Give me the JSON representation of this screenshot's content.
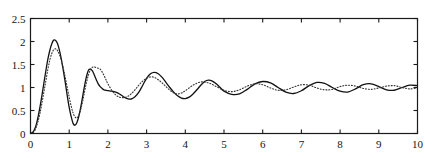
{
  "figure": {
    "background_color": "#ffffff",
    "axes_color": "#1a1a1a",
    "curve_color": "#111111"
  },
  "chart_data": {
    "type": "line",
    "title": "",
    "subtitle": "",
    "xlabel": "",
    "ylabel": "",
    "xlim": [
      0,
      10
    ],
    "ylim": [
      0,
      2.5
    ],
    "xticks": [
      0,
      1,
      2,
      3,
      4,
      5,
      6,
      7,
      8,
      9,
      10
    ],
    "xtick_labels": [
      "0",
      "1",
      "2",
      "3",
      "4",
      "5",
      "6",
      "7",
      "8",
      "9",
      "10"
    ],
    "yticks": [
      0,
      0.5,
      1,
      1.5,
      2,
      2.5
    ],
    "ytick_labels": [
      "0",
      "0.5",
      "1",
      "1.5",
      "2",
      "2.5"
    ],
    "grid": false,
    "legend": false,
    "legend_position": "none",
    "box": true,
    "tick_direction": "in",
    "steady_state_value": 1,
    "annotations": [],
    "series": [
      {
        "name": "solid-response",
        "linestyle": "solid",
        "color": "#111111",
        "linewidth": 1.3,
        "x": [
          0,
          0.05,
          0.1,
          0.15,
          0.2,
          0.25,
          0.3,
          0.35,
          0.4,
          0.45,
          0.5,
          0.55,
          0.6,
          0.65,
          0.7,
          0.75,
          0.8,
          0.85,
          0.9,
          0.95,
          1.0,
          1.05,
          1.1,
          1.15,
          1.2,
          1.25,
          1.3,
          1.35,
          1.4,
          1.45,
          1.5,
          1.55,
          1.6,
          1.65,
          1.7,
          1.75,
          1.8,
          1.85,
          1.9,
          1.95,
          2.0,
          2.1,
          2.2,
          2.3,
          2.4,
          2.5,
          2.6,
          2.7,
          2.8,
          2.9,
          3.0,
          3.1,
          3.2,
          3.3,
          3.4,
          3.5,
          3.6,
          3.7,
          3.8,
          3.9,
          4.0,
          4.1,
          4.2,
          4.3,
          4.4,
          4.5,
          4.6,
          4.7,
          4.8,
          4.9,
          5.0,
          5.2,
          5.4,
          5.6,
          5.8,
          6.0,
          6.2,
          6.4,
          6.6,
          6.8,
          7.0,
          7.2,
          7.4,
          7.6,
          7.8,
          8.0,
          8.2,
          8.4,
          8.6,
          8.8,
          9.0,
          9.2,
          9.4,
          9.6,
          9.8,
          10.0
        ],
        "y": [
          0.0,
          0.02,
          0.08,
          0.2,
          0.38,
          0.6,
          0.85,
          1.12,
          1.38,
          1.62,
          1.81,
          1.95,
          2.03,
          2.02,
          1.95,
          1.8,
          1.6,
          1.36,
          1.1,
          0.82,
          0.57,
          0.37,
          0.22,
          0.18,
          0.24,
          0.38,
          0.58,
          0.82,
          1.05,
          1.25,
          1.38,
          1.4,
          1.36,
          1.27,
          1.17,
          1.08,
          1.02,
          0.98,
          0.95,
          0.94,
          0.93,
          0.92,
          0.9,
          0.86,
          0.8,
          0.76,
          0.75,
          0.8,
          0.9,
          1.05,
          1.2,
          1.3,
          1.33,
          1.3,
          1.22,
          1.11,
          1.0,
          0.9,
          0.82,
          0.77,
          0.76,
          0.79,
          0.86,
          0.95,
          1.05,
          1.13,
          1.16,
          1.14,
          1.08,
          1.0,
          0.92,
          0.85,
          0.86,
          0.96,
          1.08,
          1.13,
          1.1,
          1.0,
          0.9,
          0.87,
          0.93,
          1.04,
          1.11,
          1.09,
          1.0,
          0.92,
          0.9,
          0.97,
          1.06,
          1.08,
          1.02,
          0.95,
          0.94,
          1.0,
          1.05,
          1.04
        ]
      },
      {
        "name": "dotted-response",
        "linestyle": "dotted",
        "color": "#333333",
        "linewidth": 1.1,
        "x": [
          0,
          0.05,
          0.1,
          0.15,
          0.2,
          0.25,
          0.3,
          0.35,
          0.4,
          0.45,
          0.5,
          0.55,
          0.6,
          0.65,
          0.7,
          0.75,
          0.8,
          0.85,
          0.9,
          0.95,
          1.0,
          1.05,
          1.1,
          1.15,
          1.2,
          1.25,
          1.3,
          1.35,
          1.4,
          1.45,
          1.5,
          1.55,
          1.6,
          1.65,
          1.7,
          1.75,
          1.8,
          1.85,
          1.9,
          1.95,
          2.0,
          2.1,
          2.2,
          2.3,
          2.4,
          2.5,
          2.6,
          2.7,
          2.8,
          2.9,
          3.0,
          3.1,
          3.2,
          3.3,
          3.4,
          3.5,
          3.6,
          3.7,
          3.8,
          3.9,
          4.0,
          4.2,
          4.4,
          4.6,
          4.8,
          5.0,
          5.2,
          5.4,
          5.6,
          5.8,
          6.0,
          6.2,
          6.4,
          6.6,
          6.8,
          7.0,
          7.2,
          7.4,
          7.6,
          7.8,
          8.0,
          8.2,
          8.4,
          8.6,
          8.8,
          9.0,
          9.2,
          9.4,
          9.6,
          9.8,
          10.0
        ],
        "y": [
          0.0,
          0.01,
          0.05,
          0.14,
          0.28,
          0.46,
          0.68,
          0.92,
          1.16,
          1.4,
          1.6,
          1.74,
          1.82,
          1.84,
          1.8,
          1.71,
          1.58,
          1.41,
          1.21,
          1.0,
          0.79,
          0.6,
          0.45,
          0.36,
          0.34,
          0.4,
          0.53,
          0.71,
          0.92,
          1.12,
          1.28,
          1.39,
          1.44,
          1.45,
          1.43,
          1.42,
          1.4,
          1.34,
          1.26,
          1.17,
          1.08,
          0.94,
          0.84,
          0.79,
          0.78,
          0.8,
          0.86,
          0.95,
          1.05,
          1.14,
          1.2,
          1.23,
          1.22,
          1.17,
          1.1,
          1.02,
          0.94,
          0.88,
          0.86,
          0.88,
          0.93,
          1.05,
          1.12,
          1.1,
          1.02,
          0.94,
          0.91,
          0.95,
          1.03,
          1.08,
          1.06,
          0.99,
          0.94,
          0.95,
          1.01,
          1.06,
          1.05,
          0.99,
          0.95,
          0.96,
          1.02,
          1.05,
          1.03,
          0.98,
          0.96,
          0.99,
          1.03,
          1.04,
          1.0,
          0.97,
          0.99
        ]
      }
    ]
  }
}
